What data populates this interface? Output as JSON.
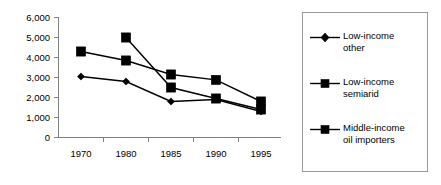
{
  "chart_data": {
    "type": "line",
    "title": "",
    "xlabel": "",
    "ylabel": "",
    "categories": [
      "1970",
      "1980",
      "1985",
      "1990",
      "1995"
    ],
    "ylim": [
      0,
      6000
    ],
    "yticks": [
      "0",
      "1,000",
      "2,000",
      "3,000",
      "4,000",
      "5,000",
      "6,000"
    ],
    "ytick_values": [
      0,
      1000,
      2000,
      3000,
      4000,
      5000,
      6000
    ],
    "grid": false,
    "legend_position": "right",
    "series": [
      {
        "name": "Low-income other",
        "marker": "diamond",
        "x": [
          "1970",
          "1980",
          "1985",
          "1990",
          "1995"
        ],
        "values": [
          3050,
          2800,
          1800,
          1900,
          1300
        ]
      },
      {
        "name": "Low-income semiarid",
        "marker": "square",
        "x": [
          "1970",
          "1980",
          "1985",
          "1990",
          "1995"
        ],
        "values": [
          4300,
          3850,
          3150,
          2880,
          1800
        ]
      },
      {
        "name": "Middle-income oil importers",
        "marker": "square",
        "x": [
          "1980",
          "1985",
          "1990",
          "1995"
        ],
        "values": [
          5000,
          2500,
          1950,
          1400
        ]
      }
    ]
  },
  "legend": {
    "items": [
      {
        "label": "Low-income\nother",
        "marker": "diamond"
      },
      {
        "label": "Low-income\nsemiarid",
        "marker": "square"
      },
      {
        "label": "Middle-income\noil importers",
        "marker": "square"
      }
    ]
  },
  "colors": {
    "series": "#000000",
    "axis": "#808080",
    "legend_border": "#9a9a9a",
    "background": "#ffffff"
  }
}
